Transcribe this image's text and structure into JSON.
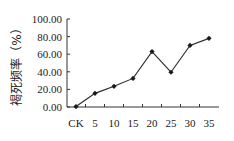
{
  "chart_data": {
    "type": "line",
    "title": "",
    "xlabel": "",
    "ylabel": "褐死频率（%）",
    "categories": [
      "CK",
      "5",
      "10",
      "15",
      "20",
      "25",
      "30",
      "35"
    ],
    "series": [
      {
        "name": "褐死频率",
        "values": [
          0.5,
          15.5,
          23.5,
          32.5,
          63.0,
          39.5,
          70.0,
          78.0
        ]
      }
    ],
    "yticks": [
      "0.00",
      "20.00",
      "40.00",
      "60.00",
      "80.00",
      "100.00"
    ],
    "ylim": [
      0,
      100
    ],
    "grid": false,
    "legend": "none",
    "colors": {
      "line": "#2a2a2a",
      "marker": "#1a1a1a",
      "axis": "#333333"
    }
  }
}
